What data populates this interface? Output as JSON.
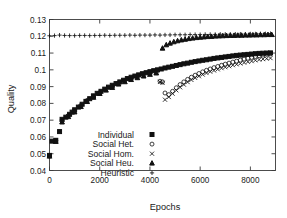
{
  "chart_data": {
    "type": "scatter",
    "title": "",
    "xlabel": "Epochs",
    "ylabel": "Quality",
    "xlim": [
      0,
      9000
    ],
    "ylim": [
      0.04,
      0.13
    ],
    "xticks": [
      0,
      2000,
      4000,
      6000,
      8000
    ],
    "xtick_labels": [
      "0",
      "2000",
      "4000",
      "6000",
      "8000"
    ],
    "yticks": [
      0.04,
      0.05,
      0.06,
      0.07,
      0.08,
      0.09,
      0.1,
      0.11,
      0.12,
      0.13
    ],
    "ytick_labels": [
      "0.04",
      "0.05",
      "0.06",
      "0.07",
      "0.08",
      "0.09",
      "0.1",
      "0.11",
      "0.12",
      "0.13"
    ],
    "grid": false,
    "legend_position": "lower-center-left",
    "series": [
      {
        "name": "Individual",
        "marker": "filled-square",
        "x": [
          0,
          100,
          250,
          400,
          500,
          650,
          800,
          900,
          1000,
          1150,
          1300,
          1450,
          1600,
          1750,
          1900,
          2050,
          2200,
          2350,
          2500,
          2650,
          2800,
          2950,
          3100,
          3250,
          3400,
          3550,
          3700,
          3850,
          4000,
          4150,
          4300,
          4450,
          4600,
          4750,
          4900,
          5050,
          5200,
          5350,
          5500,
          5650,
          5800,
          5950,
          6100,
          6250,
          6400,
          6550,
          6700,
          6850,
          7000,
          7150,
          7300,
          7450,
          7600,
          7750,
          7900,
          8050,
          8200,
          8350,
          8500,
          8650,
          8800
        ],
        "y": [
          0.049,
          0.0575,
          0.058,
          0.0632,
          0.0705,
          0.0718,
          0.0735,
          0.0748,
          0.0762,
          0.0778,
          0.0795,
          0.0812,
          0.0828,
          0.0845,
          0.086,
          0.0872,
          0.0885,
          0.0897,
          0.0908,
          0.0918,
          0.0928,
          0.0938,
          0.0948,
          0.0956,
          0.0963,
          0.097,
          0.0977,
          0.0983,
          0.0989,
          0.0995,
          0.1,
          0.1005,
          0.1011,
          0.1016,
          0.1021,
          0.1026,
          0.1031,
          0.1036,
          0.104,
          0.1045,
          0.1049,
          0.1053,
          0.1057,
          0.106,
          0.1064,
          0.1068,
          0.1071,
          0.1074,
          0.1077,
          0.108,
          0.1083,
          0.1086,
          0.1088,
          0.109,
          0.1092,
          0.1094,
          0.1096,
          0.1098,
          0.1099,
          0.11,
          0.1101
        ]
      },
      {
        "name": "Social Het.",
        "marker": "open-circle",
        "x": [
          0,
          250,
          500,
          750,
          1000,
          1250,
          1500,
          1750,
          2000,
          2250,
          2500,
          2750,
          3000,
          3250,
          3500,
          3750,
          4000,
          4250,
          4400,
          4500,
          4600,
          4750,
          4900,
          5050,
          5200,
          5350,
          5500,
          5650,
          5800,
          5950,
          6100,
          6250,
          6400,
          6550,
          6700,
          6850,
          7000,
          7150,
          7300,
          7450,
          7600,
          7750,
          7900,
          8050,
          8200,
          8350,
          8500,
          8650,
          8800
        ],
        "y": [
          0.0485,
          0.0578,
          0.0695,
          0.0728,
          0.0755,
          0.0788,
          0.0818,
          0.0842,
          0.0864,
          0.0884,
          0.09,
          0.0921,
          0.0935,
          0.0948,
          0.0958,
          0.0968,
          0.0977,
          0.0985,
          0.0932,
          0.0928,
          0.0862,
          0.0852,
          0.0872,
          0.0893,
          0.0912,
          0.0928,
          0.0943,
          0.0956,
          0.0968,
          0.0978,
          0.0988,
          0.0997,
          0.1005,
          0.1013,
          0.102,
          0.1027,
          0.1034,
          0.104,
          0.1046,
          0.1052,
          0.1058,
          0.1064,
          0.1069,
          0.1074,
          0.1079,
          0.1084,
          0.1088,
          0.1092,
          0.1096
        ]
      },
      {
        "name": "Social Hom.",
        "marker": "cross-x",
        "x": [
          0,
          250,
          500,
          750,
          1000,
          1250,
          1500,
          1750,
          2000,
          2250,
          2500,
          2750,
          3000,
          3250,
          3500,
          3750,
          4000,
          4250,
          4400,
          4500,
          4600,
          4750,
          4900,
          5050,
          5200,
          5350,
          5500,
          5650,
          5800,
          5950,
          6100,
          6250,
          6400,
          6550,
          6700,
          6850,
          7000,
          7150,
          7300,
          7450,
          7600,
          7750,
          7900,
          8050,
          8200,
          8350,
          8500,
          8650,
          8800
        ],
        "y": [
          0.0485,
          0.0575,
          0.069,
          0.0723,
          0.075,
          0.0783,
          0.0813,
          0.0838,
          0.086,
          0.088,
          0.0896,
          0.0917,
          0.0931,
          0.0944,
          0.0954,
          0.0964,
          0.0973,
          0.0982,
          0.0928,
          0.0922,
          0.0822,
          0.0838,
          0.0858,
          0.0878,
          0.0896,
          0.0912,
          0.0927,
          0.094,
          0.0952,
          0.0962,
          0.0972,
          0.0981,
          0.0989,
          0.0996,
          0.1003,
          0.101,
          0.1016,
          0.1022,
          0.1028,
          0.1033,
          0.1038,
          0.1043,
          0.1048,
          0.1052,
          0.1057,
          0.1061,
          0.1064,
          0.1067,
          0.107
        ]
      },
      {
        "name": "Social Heu.",
        "marker": "filled-triangle",
        "x": [
          0,
          250,
          500,
          750,
          1000,
          1250,
          1500,
          1750,
          2000,
          2250,
          2500,
          2750,
          3000,
          3250,
          3500,
          3750,
          4000,
          4250,
          4500,
          4650,
          4800,
          4950,
          5100,
          5250,
          5400,
          5550,
          5700,
          5850,
          6000,
          6150,
          6300,
          6450,
          6600,
          6750,
          6900,
          7050,
          7200,
          7350,
          7500,
          7650,
          7800,
          7950,
          8100,
          8250,
          8400,
          8550,
          8700,
          8850
        ],
        "y": [
          0.0485,
          0.0572,
          0.0688,
          0.072,
          0.0748,
          0.078,
          0.081,
          0.0835,
          0.0858,
          0.0878,
          0.0894,
          0.0914,
          0.0928,
          0.0941,
          0.0952,
          0.0962,
          0.0972,
          0.098,
          0.1128,
          0.1148,
          0.1158,
          0.1166,
          0.1172,
          0.1177,
          0.1181,
          0.1185,
          0.1188,
          0.1191,
          0.1193,
          0.1195,
          0.1197,
          0.1198,
          0.12,
          0.1201,
          0.1202,
          0.1203,
          0.1204,
          0.1204,
          0.1205,
          0.1205,
          0.1206,
          0.1206,
          0.1207,
          0.1207,
          0.1208,
          0.1208,
          0.1209,
          0.1209
        ]
      },
      {
        "name": "Heuristic",
        "marker": "plus",
        "x": [
          0,
          200,
          400,
          600,
          800,
          1000,
          1200,
          1400,
          1600,
          1800,
          2000,
          2200,
          2400,
          2600,
          2800,
          3000,
          3200,
          3400,
          3600,
          3800,
          4000,
          4200,
          4400,
          4600,
          4800,
          5000,
          5200,
          5400,
          5600,
          5800,
          6000,
          6200,
          6400,
          6600,
          6800,
          7000,
          7200,
          7400,
          7600,
          7800,
          8000,
          8200,
          8400,
          8600,
          8800
        ],
        "y": [
          0.1203,
          0.1204,
          0.1207,
          0.1205,
          0.1204,
          0.1204,
          0.1205,
          0.1205,
          0.1204,
          0.1205,
          0.1205,
          0.1206,
          0.1205,
          0.1206,
          0.1206,
          0.1206,
          0.1207,
          0.1206,
          0.1207,
          0.1207,
          0.1207,
          0.1208,
          0.1207,
          0.1208,
          0.1208,
          0.1209,
          0.1209,
          0.1209,
          0.121,
          0.121,
          0.121,
          0.1211,
          0.1211,
          0.1211,
          0.1212,
          0.1212,
          0.1212,
          0.1213,
          0.1213,
          0.1213,
          0.1214,
          0.1214,
          0.1215,
          0.1215,
          0.1216
        ]
      }
    ]
  },
  "legend": {
    "items": [
      {
        "label": "Individual",
        "marker": "filled-square"
      },
      {
        "label": "Social Het.",
        "marker": "open-circle"
      },
      {
        "label": "Social Hom.",
        "marker": "cross-x"
      },
      {
        "label": "Social Heu.",
        "marker": "filled-triangle"
      },
      {
        "label": "Heuristic",
        "marker": "plus"
      }
    ]
  },
  "colors": {
    "foreground": "#111111",
    "axis": "#3a3a3a",
    "background": "#ffffff"
  }
}
